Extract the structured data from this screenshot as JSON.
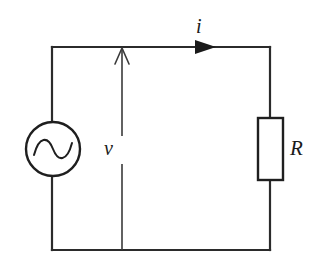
{
  "figure": {
    "type": "circuit-schematic",
    "background_color": "#ffffff",
    "stroke_color": "#2b2b2b",
    "width": 320,
    "height": 276
  },
  "labels": {
    "current": "i",
    "voltage": "v",
    "resistor": "R"
  },
  "components": {
    "source": {
      "name": "ac-voltage-source",
      "symbol": "circle-with-sine-wave",
      "center_x": 53,
      "center_y": 149,
      "radius": 27
    },
    "resistor": {
      "name": "resistor",
      "symbol": "rectangle-box",
      "x": 258,
      "y": 118,
      "width": 25,
      "height": 62
    },
    "current_arrow": {
      "name": "current-arrow",
      "direction": "right",
      "head_style": "filled-triangle",
      "tip_x": 216,
      "y": 47
    },
    "voltage_arrow": {
      "name": "voltage-arrow",
      "direction": "up",
      "head_style": "open-v",
      "x": 122,
      "top_y": 47,
      "bottom_y": 250
    }
  },
  "loop": {
    "left_x": 52,
    "right_x": 270,
    "top_y": 47,
    "bottom_y": 250
  }
}
